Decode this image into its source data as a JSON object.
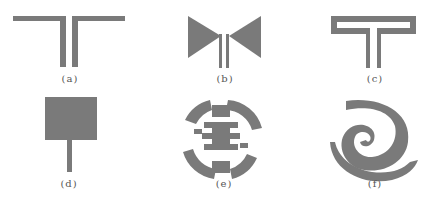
{
  "figure": {
    "shape_color": "#7a7a7a",
    "panels": [
      {
        "id": "a",
        "label": "(a)",
        "description": "T-shaped dipole with two parallel feed lines"
      },
      {
        "id": "b",
        "label": "(b)",
        "description": "bowtie antenna with parallel feed lines"
      },
      {
        "id": "c",
        "label": "(c)",
        "description": "folded T-shaped loop antenna"
      },
      {
        "id": "d",
        "label": "(d)",
        "description": "square patch with microstrip feed"
      },
      {
        "id": "e",
        "label": "(e)",
        "description": "circular fractal slot antenna"
      },
      {
        "id": "f",
        "label": "(f)",
        "description": "spiral antenna"
      }
    ]
  }
}
